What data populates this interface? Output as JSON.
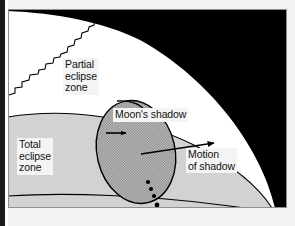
{
  "figure": {
    "type": "diagram"
  },
  "labels": {
    "partial_eclipse_zone": "Partial\neclipse\nzone",
    "total_eclipse_zone": "Total\neclipse\nzone",
    "moons_shadow": "Moon's shadow",
    "motion_of_shadow": "Motion\nof shadow"
  },
  "colors": {
    "space_black": "#000000",
    "partial_zone_white": "#ffffff",
    "total_zone_gray": "#d2d2d2",
    "shadow_ellipse_fill": "#a8a8a8",
    "outline": "#000000",
    "page_background": "#f2f2f2",
    "label_background": "#f4f4f4",
    "border_dark": "#1a1a1a"
  },
  "elements": {
    "space_region": "black-sky-region",
    "partial_zone_region": "white-partial-eclipse-band",
    "total_zone_region": "gray-total-eclipse-band",
    "shadow_ellipse": "moons-shadow-ellipse",
    "coastline": "jagged-coastline-line",
    "short_arrow": "shadow-interior-arrow",
    "long_arrow": "motion-of-shadow-arrow",
    "leader_line": "moons-shadow-leader-line",
    "path_dots": "shadow-path-dots",
    "dot_count": 4
  }
}
